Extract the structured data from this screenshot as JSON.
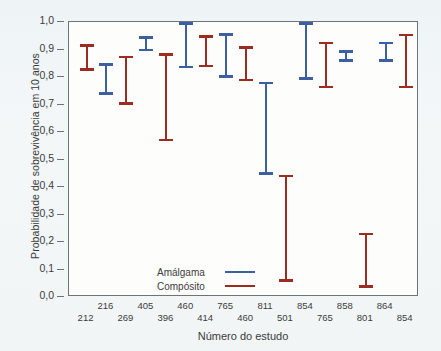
{
  "chart_data": {
    "type": "bar",
    "title": "",
    "subtitle": "",
    "xlabel": "Número do estudo",
    "ylabel": "Probabilidade de sobrevivência em 10 anos",
    "ylim": [
      0.0,
      1.0
    ],
    "ytick_labels": [
      "1,0",
      "0,9",
      "0,8",
      "0,7",
      "0,6",
      "0,5",
      "0,4",
      "0,3",
      "0,2",
      "0,1",
      "0,0"
    ],
    "ytick_values": [
      1.0,
      0.9,
      0.8,
      0.7,
      0.6,
      0.5,
      0.4,
      0.3,
      0.2,
      0.1,
      0.0
    ],
    "grid": false,
    "legend_position": "inside-lower-left",
    "legend": [
      {
        "name": "Amálgama",
        "color": "#3b5fa0"
      },
      {
        "name": "Compósito",
        "color": "#9c2b22"
      }
    ],
    "categories": [
      "212",
      "216",
      "269",
      "405",
      "396",
      "460",
      "414",
      "765",
      "460",
      "811",
      "501",
      "854",
      "765",
      "858",
      "801",
      "864",
      "854"
    ],
    "series": [
      {
        "name": "Amálgama",
        "color": "#3b5fa0",
        "points": [
          {
            "study": "216",
            "low": 0.735,
            "high": 0.85
          },
          {
            "study": "405",
            "low": 0.893,
            "high": 0.948
          },
          {
            "study": "460",
            "low": 0.832,
            "high": 1.0
          },
          {
            "study": "765",
            "low": 0.797,
            "high": 0.96
          },
          {
            "study": "811",
            "low": 0.444,
            "high": 0.782
          },
          {
            "study": "854",
            "low": 0.79,
            "high": 1.0
          },
          {
            "study": "858",
            "low": 0.856,
            "high": 0.898
          },
          {
            "study": "864",
            "low": 0.856,
            "high": 0.928
          }
        ]
      },
      {
        "name": "Compósito",
        "color": "#9c2b22",
        "points": [
          {
            "study": "212",
            "low": 0.822,
            "high": 0.92
          },
          {
            "study": "269",
            "low": 0.699,
            "high": 0.877
          },
          {
            "study": "396",
            "low": 0.566,
            "high": 0.887
          },
          {
            "study": "414",
            "low": 0.835,
            "high": 0.952
          },
          {
            "study": "460",
            "low": 0.784,
            "high": 0.911
          },
          {
            "study": "501",
            "low": 0.055,
            "high": 0.444
          },
          {
            "study": "765",
            "low": 0.759,
            "high": 0.929
          },
          {
            "study": "801",
            "low": 0.033,
            "high": 0.233
          },
          {
            "study": "854",
            "low": 0.759,
            "high": 0.958
          }
        ]
      }
    ],
    "bars": [
      {
        "index": 0,
        "study": "212",
        "series": "Compósito",
        "color": "#9c2b22",
        "low": 0.822,
        "high": 0.92,
        "label_row": "bottom"
      },
      {
        "index": 1,
        "study": "216",
        "series": "Amálgama",
        "color": "#3b5fa0",
        "low": 0.735,
        "high": 0.85,
        "label_row": "top"
      },
      {
        "index": 2,
        "study": "269",
        "series": "Compósito",
        "color": "#9c2b22",
        "low": 0.699,
        "high": 0.877,
        "label_row": "bottom"
      },
      {
        "index": 3,
        "study": "405",
        "series": "Amálgama",
        "color": "#3b5fa0",
        "low": 0.893,
        "high": 0.948,
        "label_row": "top"
      },
      {
        "index": 4,
        "study": "396",
        "series": "Compósito",
        "color": "#9c2b22",
        "low": 0.566,
        "high": 0.887,
        "label_row": "bottom"
      },
      {
        "index": 5,
        "study": "460",
        "series": "Amálgama",
        "color": "#3b5fa0",
        "low": 0.832,
        "high": 1.0,
        "label_row": "top"
      },
      {
        "index": 6,
        "study": "414",
        "series": "Compósito",
        "color": "#9c2b22",
        "low": 0.835,
        "high": 0.952,
        "label_row": "bottom"
      },
      {
        "index": 7,
        "study": "765",
        "series": "Amálgama",
        "color": "#3b5fa0",
        "low": 0.797,
        "high": 0.96,
        "label_row": "top"
      },
      {
        "index": 8,
        "study": "460",
        "series": "Compósito",
        "color": "#9c2b22",
        "low": 0.784,
        "high": 0.911,
        "label_row": "bottom"
      },
      {
        "index": 9,
        "study": "811",
        "series": "Amálgama",
        "color": "#3b5fa0",
        "low": 0.444,
        "high": 0.782,
        "label_row": "top"
      },
      {
        "index": 10,
        "study": "501",
        "series": "Compósito",
        "color": "#9c2b22",
        "low": 0.055,
        "high": 0.444,
        "label_row": "bottom"
      },
      {
        "index": 11,
        "study": "854",
        "series": "Amálgama",
        "color": "#3b5fa0",
        "low": 0.79,
        "high": 1.0,
        "label_row": "top"
      },
      {
        "index": 12,
        "study": "765",
        "series": "Compósito",
        "color": "#9c2b22",
        "low": 0.759,
        "high": 0.929,
        "label_row": "bottom"
      },
      {
        "index": 13,
        "study": "858",
        "series": "Amálgama",
        "color": "#3b5fa0",
        "low": 0.856,
        "high": 0.898,
        "label_row": "top"
      },
      {
        "index": 14,
        "study": "801",
        "series": "Compósito",
        "color": "#9c2b22",
        "low": 0.033,
        "high": 0.233,
        "label_row": "bottom"
      },
      {
        "index": 15,
        "study": "864",
        "series": "Amálgama",
        "color": "#3b5fa0",
        "low": 0.856,
        "high": 0.928,
        "label_row": "top"
      },
      {
        "index": 16,
        "study": "854",
        "series": "Compósito",
        "color": "#9c2b22",
        "low": 0.759,
        "high": 0.958,
        "label_row": "bottom"
      }
    ]
  }
}
